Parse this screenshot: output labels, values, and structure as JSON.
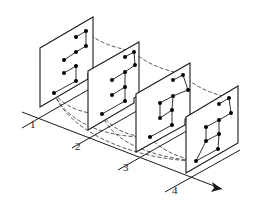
{
  "diagram": {
    "type": "isometric sequence of planes with node graphs",
    "labels": [
      "1",
      "2",
      "3",
      "4"
    ],
    "panels": [
      {
        "id": "1",
        "nodes": 9
      },
      {
        "id": "2",
        "nodes": 9
      },
      {
        "id": "3",
        "nodes": 9
      },
      {
        "id": "4",
        "nodes": 9
      }
    ],
    "axis": {
      "direction": "arrow toward label 4"
    },
    "colors": {
      "line": "#1a1a1a",
      "background": "#ffffff"
    }
  }
}
